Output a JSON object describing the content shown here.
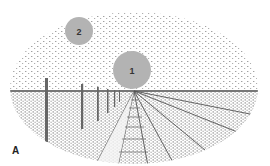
{
  "figure": {
    "panel_label": "A",
    "discs": [
      {
        "label": "1",
        "cx": 132,
        "cy": 70,
        "r": 19,
        "color": "#b3b3b3"
      },
      {
        "label": "2",
        "cx": 79,
        "cy": 31,
        "r": 14,
        "color": "#b3b3b3"
      }
    ],
    "horizon_y": 90,
    "vanishing_point": {
      "x": 134,
      "y": 91
    },
    "colors": {
      "ink": "#555555",
      "disc": "#b3b3b3",
      "background": "#ffffff"
    }
  }
}
